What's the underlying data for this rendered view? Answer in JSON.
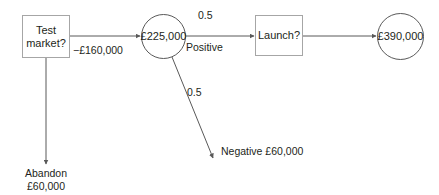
{
  "diagram": {
    "type": "decision-tree",
    "title": "",
    "background_color": "#ffffff",
    "line_color": "#595959",
    "text_color": "#231f20",
    "nodes": [
      {
        "id": "test-market",
        "shape": "rectangle",
        "label": "Test\nmarket?",
        "kind": "decision"
      },
      {
        "id": "chance-225000",
        "shape": "circle",
        "label": "£225,000",
        "kind": "chance"
      },
      {
        "id": "launch",
        "shape": "rectangle",
        "label": "Launch?",
        "kind": "decision"
      },
      {
        "id": "outcome-390000",
        "shape": "circle",
        "label": "£390,000",
        "kind": "chance"
      }
    ],
    "edge_labels": {
      "test_to_chance_cost": "−£160,000",
      "positive_probability": "0.5",
      "positive_branch": "Positive",
      "negative_probability": "0.5",
      "negative_branch": "Negative £60,000"
    },
    "terminals": [
      {
        "id": "abandon",
        "label": "Abandon\n£60,000"
      }
    ]
  }
}
